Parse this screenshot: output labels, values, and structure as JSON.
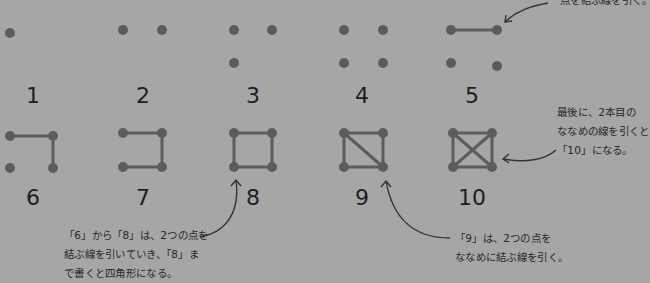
{
  "colors": {
    "background": "#a6a6a6",
    "dot": "#5c5c5c",
    "line": "#5c5c5c",
    "text": "#1e1e1e",
    "arrow": "#333333"
  },
  "figures": [
    {
      "label": "1",
      "label_pos": [
        33,
        85
      ],
      "dots": [
        [
          10,
          33
        ]
      ],
      "lines": []
    },
    {
      "label": "2",
      "label_pos": [
        143,
        85
      ],
      "dots": [
        [
          123,
          30
        ],
        [
          162,
          30
        ]
      ],
      "lines": []
    },
    {
      "label": "3",
      "label_pos": [
        253,
        85
      ],
      "dots": [
        [
          234,
          30
        ],
        [
          272,
          30
        ],
        [
          234,
          63
        ]
      ],
      "lines": []
    },
    {
      "label": "4",
      "label_pos": [
        362,
        85
      ],
      "dots": [
        [
          344,
          30
        ],
        [
          383,
          30
        ],
        [
          344,
          63
        ],
        [
          383,
          63
        ]
      ],
      "lines": []
    },
    {
      "label": "5",
      "label_pos": [
        472,
        85
      ],
      "dots": [
        [
          451,
          30
        ],
        [
          497,
          30
        ],
        [
          451,
          63
        ],
        [
          497,
          66
        ]
      ],
      "lines": [
        [
          0,
          1
        ]
      ]
    },
    {
      "label": "6",
      "label_pos": [
        33,
        187
      ],
      "dots": [
        [
          10,
          136
        ],
        [
          53,
          136
        ],
        [
          10,
          168
        ],
        [
          53,
          168
        ]
      ],
      "lines": [
        [
          0,
          1
        ],
        [
          1,
          3
        ]
      ]
    },
    {
      "label": "7",
      "label_pos": [
        143,
        187
      ],
      "dots": [
        [
          123,
          133
        ],
        [
          162,
          133
        ],
        [
          123,
          167
        ],
        [
          162,
          167
        ]
      ],
      "lines": [
        [
          0,
          1
        ],
        [
          1,
          3
        ],
        [
          3,
          2
        ]
      ]
    },
    {
      "label": "8",
      "label_pos": [
        253,
        187
      ],
      "dots": [
        [
          234,
          133
        ],
        [
          272,
          133
        ],
        [
          234,
          167
        ],
        [
          272,
          167
        ]
      ],
      "lines": [
        [
          0,
          1
        ],
        [
          1,
          3
        ],
        [
          3,
          2
        ],
        [
          2,
          0
        ]
      ]
    },
    {
      "label": "9",
      "label_pos": [
        362,
        187
      ],
      "dots": [
        [
          344,
          133
        ],
        [
          383,
          133
        ],
        [
          344,
          167
        ],
        [
          383,
          167
        ]
      ],
      "lines": [
        [
          0,
          1
        ],
        [
          1,
          3
        ],
        [
          3,
          2
        ],
        [
          2,
          0
        ],
        [
          0,
          3
        ]
      ]
    },
    {
      "label": "10",
      "label_pos": [
        472,
        187
      ],
      "dots": [
        [
          453,
          133
        ],
        [
          492,
          133
        ],
        [
          453,
          167
        ],
        [
          492,
          167
        ]
      ],
      "lines": [
        [
          0,
          1
        ],
        [
          1,
          3
        ],
        [
          3,
          2
        ],
        [
          2,
          0
        ],
        [
          0,
          3
        ],
        [
          1,
          2
        ]
      ]
    }
  ],
  "notes": {
    "top_right": {
      "lines": [
        "点を結ぶ線を引く。"
      ]
    },
    "right": {
      "lines": [
        "最後に、2本目の",
        "ななめの線を引くと",
        "「10」になる。"
      ]
    },
    "bottom_left": {
      "lines": [
        "「6」から「8」は、2つの点を",
        "結ぶ線を引いていき、「8」ま",
        "で書くと四角形になる。"
      ]
    },
    "bottom_right": {
      "lines": [
        "「9」は、2つの点を",
        "ななめに結ぶ線を引く。"
      ]
    }
  },
  "arrows": [
    {
      "name": "arrow-to-figure-5",
      "path": "M 548 3 C 530 6, 515 12, 505 22",
      "head": [
        505,
        22
      ],
      "head_dir": "down-left"
    },
    {
      "name": "arrow-to-figure-10",
      "path": "M 556 150 C 545 160, 525 163, 503 159",
      "head": [
        503,
        159
      ],
      "head_dir": "left"
    },
    {
      "name": "arrow-to-figure-8",
      "path": "M 200 237 C 228 232, 240 210, 236 180",
      "head": [
        236,
        180
      ],
      "head_dir": "up"
    },
    {
      "name": "arrow-to-figure-9",
      "path": "M 450 238 C 410 238, 392 215, 386 181",
      "head": [
        386,
        181
      ],
      "head_dir": "up"
    }
  ]
}
